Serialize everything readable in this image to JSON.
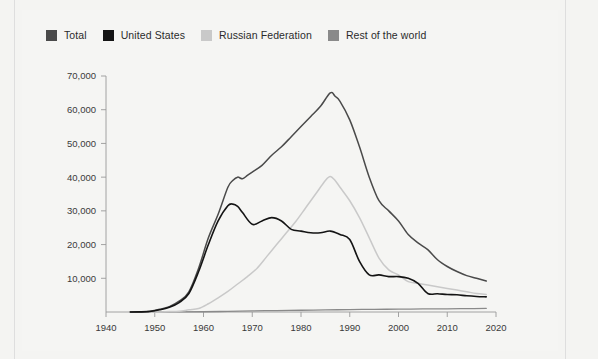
{
  "legend": {
    "position": "top-left",
    "items": [
      {
        "label": "Total",
        "color": "#4a4a4a",
        "swatch_name": "legend-swatch-total"
      },
      {
        "label": "United States",
        "color": "#141414",
        "swatch_name": "legend-swatch-united-states"
      },
      {
        "label": "Russian Federation",
        "color": "#c9c9c9",
        "swatch_name": "legend-swatch-russian-federation"
      },
      {
        "label": "Rest of the world",
        "color": "#8a8a8a",
        "swatch_name": "legend-swatch-rest-of-the-world"
      }
    ]
  },
  "axes": {
    "y_ticks": [
      "10,000",
      "20,000",
      "30,000",
      "40,000",
      "50,000",
      "60,000",
      "70,000"
    ],
    "x_ticks": [
      "1940",
      "1950",
      "1960",
      "1970",
      "1980",
      "1990",
      "2000",
      "2010",
      "2020"
    ]
  },
  "chart_data": {
    "type": "line",
    "title": "",
    "subtitle": "",
    "xlabel": "",
    "ylabel": "",
    "xlim": [
      1940,
      2020
    ],
    "ylim": [
      0,
      70000
    ],
    "grid": false,
    "legend_position": "top-left",
    "xticks": [
      1940,
      1950,
      1960,
      1970,
      1980,
      1990,
      2000,
      2010,
      2020
    ],
    "yticks": [
      10000,
      20000,
      30000,
      40000,
      50000,
      60000,
      70000
    ],
    "ytick_labels": [
      "10,000",
      "20,000",
      "30,000",
      "40,000",
      "50,000",
      "60,000",
      "70,000"
    ],
    "series": [
      {
        "name": "Total",
        "color": "#4a4a4a",
        "x": [
          1945,
          1947,
          1949,
          1951,
          1953,
          1955,
          1957,
          1959,
          1961,
          1963,
          1965,
          1966,
          1967,
          1968,
          1969,
          1970,
          1972,
          1974,
          1976,
          1978,
          1980,
          1982,
          1984,
          1986,
          1987,
          1988,
          1990,
          1992,
          1994,
          1996,
          1998,
          2000,
          2002,
          2004,
          2006,
          2008,
          2010,
          2012,
          2014,
          2016,
          2018
        ],
        "values": [
          2,
          60,
          250,
          800,
          1600,
          3200,
          6000,
          13000,
          22000,
          29000,
          37000,
          39000,
          40000,
          39500,
          40500,
          41500,
          43500,
          46500,
          49000,
          52000,
          55000,
          58000,
          61000,
          65000,
          64000,
          62500,
          57000,
          49000,
          40000,
          33000,
          30000,
          27000,
          23000,
          20500,
          18500,
          15500,
          13500,
          12000,
          10800,
          10000,
          9200
        ]
      },
      {
        "name": "United States",
        "color": "#141414",
        "x": [
          1945,
          1947,
          1949,
          1951,
          1953,
          1955,
          1957,
          1959,
          1961,
          1963,
          1965,
          1966,
          1967,
          1968,
          1970,
          1972,
          1974,
          1976,
          1978,
          1980,
          1982,
          1984,
          1986,
          1988,
          1990,
          1992,
          1994,
          1996,
          1998,
          2000,
          2002,
          2004,
          2006,
          2008,
          2010,
          2012,
          2014,
          2016,
          2018
        ],
        "values": [
          2,
          32,
          170,
          640,
          1400,
          2800,
          5500,
          12000,
          20000,
          27000,
          31500,
          32000,
          31300,
          29500,
          26000,
          27000,
          28000,
          27000,
          24500,
          24000,
          23500,
          23500,
          24000,
          23000,
          21500,
          15000,
          11000,
          11000,
          10500,
          10500,
          10000,
          8500,
          5500,
          5400,
          5200,
          5100,
          4800,
          4600,
          4500
        ]
      },
      {
        "name": "Russian Federation",
        "color": "#c9c9c9",
        "x": [
          1949,
          1951,
          1953,
          1955,
          1957,
          1959,
          1961,
          1963,
          1965,
          1967,
          1969,
          1971,
          1973,
          1975,
          1977,
          1979,
          1981,
          1983,
          1985,
          1986,
          1987,
          1988,
          1990,
          1992,
          1994,
          1996,
          1998,
          2000,
          2002,
          2004,
          2006,
          2008,
          2010,
          2012,
          2014,
          2016,
          2018
        ],
        "values": [
          1,
          25,
          120,
          200,
          650,
          1050,
          2450,
          4200,
          6100,
          8300,
          10500,
          13000,
          16500,
          20000,
          23500,
          27000,
          31000,
          35000,
          39000,
          40200,
          39000,
          37000,
          33000,
          28000,
          22000,
          16000,
          12500,
          11000,
          9000,
          8500,
          8000,
          7500,
          7000,
          6500,
          6000,
          5500,
          5200
        ]
      },
      {
        "name": "Rest of the world",
        "color": "#8a8a8a",
        "x": [
          1945,
          1952,
          1960,
          1965,
          1970,
          1975,
          1980,
          1985,
          1990,
          1995,
          2000,
          2005,
          2010,
          2014,
          2018
        ],
        "values": [
          0,
          20,
          80,
          180,
          330,
          420,
          520,
          620,
          720,
          780,
          850,
          900,
          950,
          1000,
          1050
        ]
      }
    ]
  }
}
